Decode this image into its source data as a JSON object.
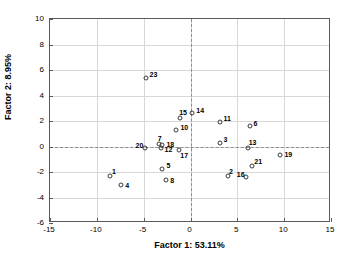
{
  "chart_data": {
    "type": "scatter",
    "title": "",
    "xlabel": "Factor 1: 53.11%",
    "ylabel": "Factor 2: 8.95%",
    "xlim": [
      -15,
      15
    ],
    "ylim": [
      -6,
      10
    ],
    "xticks": [
      -15,
      -10,
      -5,
      0,
      5,
      10,
      15
    ],
    "yticks": [
      -6,
      -4,
      -2,
      0,
      2,
      4,
      6,
      8,
      10
    ],
    "grid": true,
    "legend": "none",
    "reference_lines": {
      "vertical_at_x": 0,
      "horizontal_at_y": 0,
      "style": "dashed"
    },
    "marker": {
      "shape": "open-circle",
      "edge_color": "#3a3a3a",
      "fill": "none"
    },
    "points": [
      {
        "label": "1",
        "x": -8.6,
        "y": -2.3,
        "label_dx": 2,
        "label_dy": -8
      },
      {
        "label": "2",
        "x": 4.0,
        "y": -2.3,
        "label_dx": 1,
        "label_dy": -8
      },
      {
        "label": "3",
        "x": 3.1,
        "y": 0.3,
        "label_dx": 4,
        "label_dy": -7
      },
      {
        "label": "4",
        "x": -7.4,
        "y": -3.0,
        "label_dx": 4,
        "label_dy": -3
      },
      {
        "label": "5",
        "x": -3.0,
        "y": -1.8,
        "label_dx": 4,
        "label_dy": -7
      },
      {
        "label": "6",
        "x": 6.3,
        "y": 1.6,
        "label_dx": 4,
        "label_dy": -6
      },
      {
        "label": "7",
        "x": -3.4,
        "y": 0.2,
        "label_dx": -1,
        "label_dy": -9
      },
      {
        "label": "8",
        "x": -2.6,
        "y": -2.6,
        "label_dx": 4,
        "label_dy": -3
      },
      {
        "label": "10",
        "x": -1.5,
        "y": 1.3,
        "label_dx": 4,
        "label_dy": -6
      },
      {
        "label": "11",
        "x": 3.1,
        "y": 1.9,
        "label_dx": 4,
        "label_dy": -7
      },
      {
        "label": "12",
        "x": -3.2,
        "y": -0.1,
        "label_dx": 4,
        "label_dy": -2
      },
      {
        "label": "13",
        "x": 6.1,
        "y": -0.1,
        "label_dx": 1,
        "label_dy": -9
      },
      {
        "label": "14",
        "x": 0.2,
        "y": 2.6,
        "label_dx": 4,
        "label_dy": -6
      },
      {
        "label": "15",
        "x": -1.1,
        "y": 2.2,
        "label_dx": -1,
        "label_dy": -9
      },
      {
        "label": "16",
        "x": 5.9,
        "y": -2.4,
        "label_dx": -9,
        "label_dy": -6
      },
      {
        "label": "17",
        "x": -1.2,
        "y": -0.3,
        "label_dx": 1,
        "label_dy": 2
      },
      {
        "label": "18",
        "x": -3.0,
        "y": 0.1,
        "label_dx": 4,
        "label_dy": -4
      },
      {
        "label": "19",
        "x": 9.6,
        "y": -0.7,
        "label_dx": 4,
        "label_dy": -4
      },
      {
        "label": "20",
        "x": -4.9,
        "y": -0.1,
        "label_dx": -9,
        "label_dy": -6
      },
      {
        "label": "21",
        "x": 6.6,
        "y": -1.5,
        "label_dx": 2,
        "label_dy": -8
      },
      {
        "label": "23",
        "x": -4.8,
        "y": 5.4,
        "label_dx": 4,
        "label_dy": -7
      }
    ]
  }
}
